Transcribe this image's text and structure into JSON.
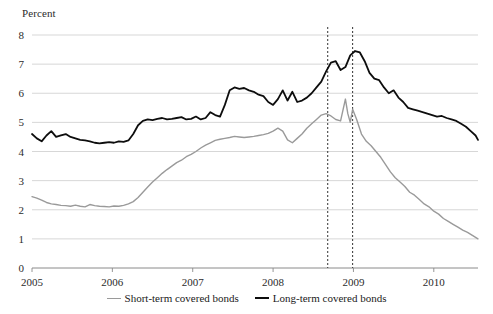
{
  "chart_data": {
    "type": "line",
    "title": "",
    "xlabel": "",
    "ylabel": "Percent",
    "ylim": [
      0,
      8
    ],
    "xlim": [
      2005.0,
      2010.55
    ],
    "yticks": [
      0,
      1,
      2,
      3,
      4,
      5,
      6,
      7,
      8
    ],
    "xticks": [
      2005,
      2006,
      2007,
      2008,
      2009,
      2010
    ],
    "grid": "horizontal",
    "legend_position": "bottom",
    "annotations": [
      {
        "type": "vline",
        "x": 2008.68,
        "style": "dotted",
        "color": "#333333"
      },
      {
        "type": "vline",
        "x": 2008.99,
        "style": "dotted",
        "color": "#333333"
      }
    ],
    "series": [
      {
        "name": "Short-term covered bonds",
        "color": "#9a9a9a",
        "width": 1.4,
        "x": [
          2005.0,
          2005.06,
          2005.12,
          2005.18,
          2005.24,
          2005.3,
          2005.36,
          2005.42,
          2005.48,
          2005.54,
          2005.6,
          2005.66,
          2005.72,
          2005.78,
          2005.84,
          2005.9,
          2005.96,
          2006.02,
          2006.08,
          2006.14,
          2006.2,
          2006.26,
          2006.32,
          2006.38,
          2006.44,
          2006.5,
          2006.56,
          2006.62,
          2006.68,
          2006.74,
          2006.8,
          2006.86,
          2006.92,
          2006.98,
          2007.04,
          2007.1,
          2007.16,
          2007.22,
          2007.28,
          2007.34,
          2007.4,
          2007.46,
          2007.52,
          2007.58,
          2007.64,
          2007.7,
          2007.76,
          2007.82,
          2007.88,
          2007.94,
          2008.0,
          2008.06,
          2008.12,
          2008.18,
          2008.24,
          2008.3,
          2008.36,
          2008.42,
          2008.48,
          2008.54,
          2008.6,
          2008.66,
          2008.72,
          2008.78,
          2008.84,
          2008.9,
          2008.93,
          2008.96,
          2008.99,
          2009.04,
          2009.1,
          2009.16,
          2009.22,
          2009.28,
          2009.34,
          2009.4,
          2009.46,
          2009.52,
          2009.58,
          2009.64,
          2009.7,
          2009.76,
          2009.82,
          2009.88,
          2009.94,
          2010.0,
          2010.06,
          2010.12,
          2010.18,
          2010.24,
          2010.3,
          2010.36,
          2010.42,
          2010.48,
          2010.55
        ],
        "values": [
          2.45,
          2.4,
          2.33,
          2.25,
          2.2,
          2.18,
          2.15,
          2.14,
          2.12,
          2.16,
          2.12,
          2.1,
          2.18,
          2.14,
          2.12,
          2.11,
          2.1,
          2.13,
          2.12,
          2.15,
          2.2,
          2.28,
          2.42,
          2.6,
          2.78,
          2.95,
          3.1,
          3.25,
          3.38,
          3.5,
          3.62,
          3.7,
          3.82,
          3.9,
          4.0,
          4.12,
          4.22,
          4.3,
          4.38,
          4.42,
          4.45,
          4.48,
          4.52,
          4.5,
          4.48,
          4.5,
          4.52,
          4.55,
          4.58,
          4.62,
          4.7,
          4.8,
          4.7,
          4.4,
          4.3,
          4.45,
          4.6,
          4.8,
          4.95,
          5.1,
          5.25,
          5.3,
          5.22,
          5.1,
          5.05,
          5.8,
          5.3,
          5.0,
          5.45,
          5.1,
          4.6,
          4.35,
          4.2,
          4.0,
          3.8,
          3.55,
          3.3,
          3.1,
          2.95,
          2.8,
          2.6,
          2.5,
          2.35,
          2.2,
          2.1,
          1.95,
          1.85,
          1.7,
          1.6,
          1.5,
          1.4,
          1.3,
          1.22,
          1.12,
          1.0
        ]
      },
      {
        "name": "Long-term covered bonds",
        "color": "#0d0d0d",
        "width": 1.8,
        "x": [
          2005.0,
          2005.06,
          2005.12,
          2005.18,
          2005.24,
          2005.3,
          2005.36,
          2005.42,
          2005.48,
          2005.54,
          2005.6,
          2005.66,
          2005.72,
          2005.78,
          2005.84,
          2005.9,
          2005.96,
          2006.02,
          2006.08,
          2006.14,
          2006.2,
          2006.26,
          2006.32,
          2006.38,
          2006.44,
          2006.5,
          2006.56,
          2006.62,
          2006.68,
          2006.74,
          2006.8,
          2006.86,
          2006.92,
          2006.98,
          2007.04,
          2007.1,
          2007.16,
          2007.22,
          2007.28,
          2007.34,
          2007.4,
          2007.46,
          2007.52,
          2007.58,
          2007.64,
          2007.7,
          2007.76,
          2007.82,
          2007.88,
          2007.94,
          2008.0,
          2008.06,
          2008.12,
          2008.18,
          2008.24,
          2008.3,
          2008.36,
          2008.42,
          2008.48,
          2008.54,
          2008.6,
          2008.66,
          2008.72,
          2008.78,
          2008.84,
          2008.9,
          2008.96,
          2009.02,
          2009.08,
          2009.14,
          2009.2,
          2009.26,
          2009.32,
          2009.38,
          2009.44,
          2009.5,
          2009.56,
          2009.62,
          2009.68,
          2009.74,
          2009.8,
          2009.86,
          2009.92,
          2009.98,
          2010.04,
          2010.1,
          2010.16,
          2010.22,
          2010.28,
          2010.34,
          2010.4,
          2010.46,
          2010.52,
          2010.55
        ],
        "values": [
          4.6,
          4.45,
          4.35,
          4.55,
          4.7,
          4.5,
          4.55,
          4.6,
          4.5,
          4.45,
          4.4,
          4.38,
          4.35,
          4.3,
          4.28,
          4.3,
          4.32,
          4.3,
          4.35,
          4.33,
          4.38,
          4.6,
          4.9,
          5.05,
          5.1,
          5.08,
          5.12,
          5.15,
          5.1,
          5.12,
          5.15,
          5.18,
          5.1,
          5.12,
          5.2,
          5.1,
          5.15,
          5.35,
          5.25,
          5.2,
          5.6,
          6.1,
          6.2,
          6.15,
          6.18,
          6.1,
          6.05,
          5.95,
          5.9,
          5.7,
          5.6,
          5.8,
          6.1,
          5.75,
          6.05,
          5.7,
          5.75,
          5.85,
          6.0,
          6.2,
          6.4,
          6.75,
          7.05,
          7.1,
          6.8,
          6.9,
          7.3,
          7.45,
          7.4,
          7.1,
          6.7,
          6.5,
          6.45,
          6.2,
          6.0,
          6.1,
          5.85,
          5.7,
          5.5,
          5.45,
          5.4,
          5.35,
          5.3,
          5.25,
          5.2,
          5.22,
          5.15,
          5.1,
          5.05,
          4.95,
          4.85,
          4.7,
          4.55,
          4.4
        ]
      }
    ]
  },
  "legend": {
    "items": [
      {
        "label": "Short-term covered bonds",
        "color": "#9a9a9a",
        "thickness": "1.4px"
      },
      {
        "label": "Long-term covered bonds",
        "color": "#0d0d0d",
        "thickness": "2.2px"
      }
    ]
  }
}
